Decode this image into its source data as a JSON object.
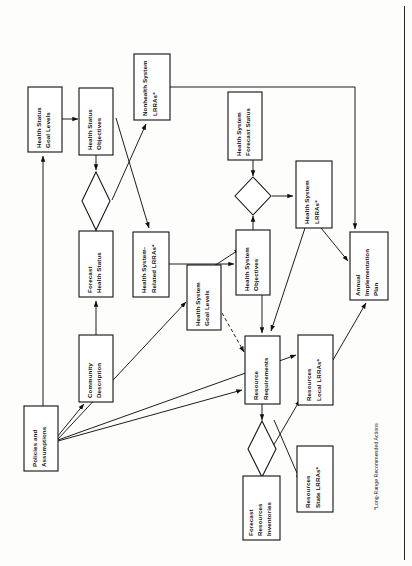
{
  "figure": {
    "orientation": "rotated-90-ccw",
    "footnote": "*Long-Range Recommended Actions",
    "line_color": "#111111",
    "box_fill": "#ffffff",
    "background": "#fdfdfc"
  },
  "nodes": [
    {
      "id": "health_status_goal_levels",
      "label_line1": "Health Status",
      "label_line2": "Goal Levels"
    },
    {
      "id": "health_status_objectives",
      "label_line1": "Health Status",
      "label_line2": "Objectives"
    },
    {
      "id": "nonhealth_system_lrras",
      "label_line1": "Nonhealth System",
      "label_line2": "LRRAs*"
    },
    {
      "id": "health_system_forecast_status",
      "label_line1": "Health System",
      "label_line2": "Forecast Status"
    },
    {
      "id": "forecast_health_status",
      "label_line1": "Forecast",
      "label_line2": "Health Status"
    },
    {
      "id": "health_system_related_lrras",
      "label_line1": "Health System-",
      "label_line2": "Related LRRAs*"
    },
    {
      "id": "health_system_goal_levels",
      "label_line1": "Health System",
      "label_line2": "Goal Levels"
    },
    {
      "id": "health_system_objectives",
      "label_line1": "Health System",
      "label_line2": "Objectives"
    },
    {
      "id": "health_system_lrras",
      "label_line1": "Health System",
      "label_line2": "LRRAs*"
    },
    {
      "id": "annual_implementation_plan",
      "label_line1": "Annual",
      "label_line2": "Implementation",
      "label_line3": "Plan"
    },
    {
      "id": "community_description",
      "label_line1": "Community",
      "label_line2": "Description"
    },
    {
      "id": "policies_and_assumptions",
      "label_line1": "Policies and",
      "label_line2": "Assumptions"
    },
    {
      "id": "resource_requirements",
      "label_line1": "Resource",
      "label_line2": "Requirements"
    },
    {
      "id": "resources_local_lrras",
      "label_line1": "Resources",
      "label_line2": "Local LRRAs*"
    },
    {
      "id": "resources_state_lrras",
      "label_line1": "Resources",
      "label_line2": "State LRRAs*"
    },
    {
      "id": "forecast_resources_inventories",
      "label_line1": "Forecast",
      "label_line2": "Resources",
      "label_line3": "Inventories"
    }
  ],
  "decision_nodes": [
    {
      "id": "decision_health_status"
    },
    {
      "id": "decision_health_system"
    },
    {
      "id": "decision_resources"
    }
  ]
}
